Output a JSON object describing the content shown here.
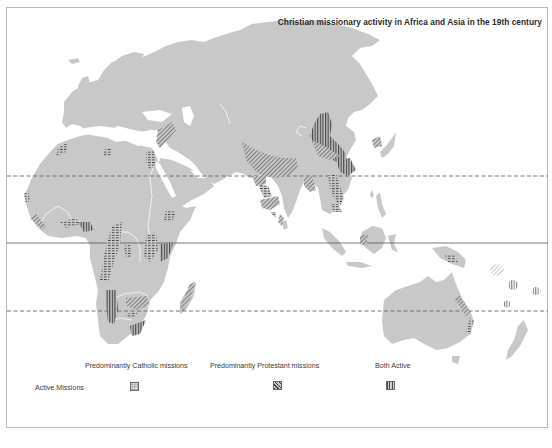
{
  "map": {
    "title": "Christian missionary activity in Africa and Asia in the 19th century",
    "regions_shown": [
      "Europe",
      "Africa",
      "Middle East",
      "Asia",
      "South-East Asia",
      "Australia",
      "Pacific Islands"
    ],
    "reference_lines": [
      {
        "name": "Tropic of Cancer",
        "style": "dashed"
      },
      {
        "name": "Equator",
        "style": "solid"
      },
      {
        "name": "Tropic of Capricorn",
        "style": "dashed"
      }
    ],
    "colors": {
      "land": "#c8c8c8",
      "hatching": "#3c3c3c",
      "rivers": "#f2f2f2",
      "border": "#b9b9b9",
      "background": "#ffffff"
    }
  },
  "legend": {
    "row_label": "Active Missions",
    "items": [
      {
        "label": "Predominantly Catholic missions",
        "pattern": "dotted-crosshatch"
      },
      {
        "label": "Predominantly Protestant missions",
        "pattern": "diagonal-hatch"
      },
      {
        "label": "Both Active",
        "pattern": "vertical-hatch"
      }
    ]
  }
}
